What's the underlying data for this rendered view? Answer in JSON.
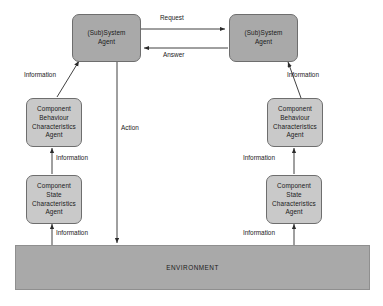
{
  "diagram": {
    "colors": {
      "agent_fill": "#a9a9a9",
      "component_fill": "#c9c9c9",
      "environment_fill": "#a9a9a9",
      "stroke": "#6e6e6e",
      "text": "#1a1a1a",
      "background": "#ffffff"
    },
    "nodes": {
      "left_system_agent": {
        "line1": "(Sub)System",
        "line2": "Agent"
      },
      "right_system_agent": {
        "line1": "(Sub)System",
        "line2": "Agent"
      },
      "left_behaviour_agent": {
        "line1": "Component",
        "line2": "Behaviour",
        "line3": "Characteristics",
        "line4": "Agent"
      },
      "right_behaviour_agent": {
        "line1": "Component",
        "line2": "Behaviour",
        "line3": "Characteristics",
        "line4": "Agent"
      },
      "left_state_agent": {
        "line1": "Component",
        "line2": "State",
        "line3": "Characteristics",
        "line4": "Agent"
      },
      "right_state_agent": {
        "line1": "Component",
        "line2": "State",
        "line3": "Characteristics",
        "line4": "Agent"
      },
      "environment": {
        "label": "ENVIRONMENT"
      }
    },
    "edge_labels": {
      "request": "Request",
      "answer": "Answer",
      "action": "Action",
      "left_upper_information": "Information",
      "left_middle_information": "Information",
      "left_lower_information": "Information",
      "right_upper_information": "Information",
      "right_middle_information": "Information",
      "right_lower_information": "Information"
    }
  }
}
